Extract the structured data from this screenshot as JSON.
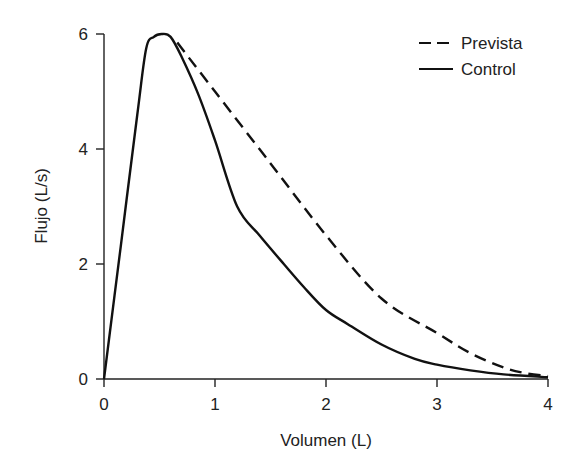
{
  "chart_data": {
    "type": "line",
    "title": "",
    "xlabel": "Volumen (L)",
    "ylabel": "Flujo (L/s)",
    "xlim": [
      0,
      4
    ],
    "ylim": [
      0,
      6
    ],
    "xticks": [
      0,
      1,
      2,
      3,
      4
    ],
    "yticks": [
      0,
      2,
      4,
      6
    ],
    "grid": false,
    "legend_position": "top-right",
    "series": [
      {
        "name": "Prevista",
        "style": "dashed",
        "color": "#111111",
        "x": [
          0.66,
          1.0,
          1.5,
          2.0,
          2.5,
          3.0,
          3.3,
          3.6,
          3.8,
          4.0
        ],
        "y": [
          5.85,
          5.0,
          3.75,
          2.5,
          1.4,
          0.8,
          0.45,
          0.2,
          0.1,
          0.05
        ]
      },
      {
        "name": "Control",
        "style": "solid",
        "color": "#111111",
        "x": [
          0.0,
          0.15,
          0.3,
          0.38,
          0.45,
          0.52,
          0.6,
          0.7,
          0.85,
          1.0,
          1.2,
          1.4,
          1.62,
          1.8,
          2.0,
          2.2,
          2.5,
          2.8,
          3.0,
          3.3,
          3.6,
          4.0
        ],
        "y": [
          0.0,
          2.3,
          4.6,
          5.75,
          5.95,
          6.0,
          5.95,
          5.6,
          4.95,
          4.15,
          3.0,
          2.5,
          2.0,
          1.6,
          1.2,
          0.95,
          0.6,
          0.35,
          0.25,
          0.15,
          0.08,
          0.03
        ]
      }
    ]
  }
}
